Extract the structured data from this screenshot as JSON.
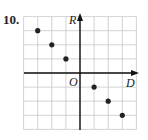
{
  "problem_number": "10.",
  "chart_data": {
    "type": "scatter",
    "title": "",
    "xlabel": "D",
    "ylabel": "R",
    "origin_label": "O",
    "grid": true,
    "xlim": [
      -4,
      4
    ],
    "ylim": [
      -4,
      4
    ],
    "points": [
      [
        -3,
        3
      ],
      [
        -2,
        2
      ],
      [
        -1,
        1
      ],
      [
        1,
        -1
      ],
      [
        2,
        -2
      ],
      [
        3,
        -3
      ]
    ]
  }
}
